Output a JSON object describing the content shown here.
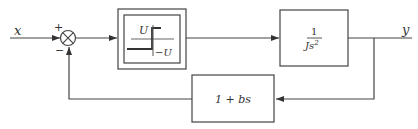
{
  "diagram": {
    "type": "block-diagram",
    "title": "",
    "input_label": "x",
    "output_label": "y",
    "summing_junction": {
      "plus_sign": "+",
      "minus_sign": "−"
    },
    "blocks": [
      {
        "id": "relay",
        "kind": "relay-nonlinearity",
        "upper_label": "U",
        "lower_label": "−U"
      },
      {
        "id": "plant",
        "numerator": "1",
        "denominator_coef": "J",
        "denominator_var": "s",
        "denominator_exp": "2"
      },
      {
        "id": "feedback",
        "label": "1 + bs"
      }
    ],
    "connections": [
      {
        "from": "x",
        "to": "summing_junction",
        "sign": "+"
      },
      {
        "from": "summing_junction",
        "to": "relay"
      },
      {
        "from": "relay",
        "to": "plant"
      },
      {
        "from": "plant",
        "to": "y"
      },
      {
        "from": "y",
        "to": "feedback"
      },
      {
        "from": "feedback",
        "to": "summing_junction",
        "sign": "-"
      }
    ],
    "colors": {
      "line": "#444444",
      "background": "#ffffff"
    }
  }
}
